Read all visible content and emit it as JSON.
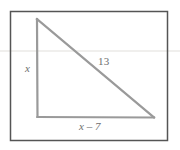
{
  "figure": {
    "kind": "geometry-diagram",
    "shape": "right-triangle",
    "background_color": "#ffffff",
    "frame": {
      "name": "diagram-border",
      "color": "#555555",
      "stroke_width": 1.5,
      "x": 10.5,
      "y": 11.5,
      "width": 157,
      "height": 129
    },
    "triangle": {
      "color": "#9a9a9a",
      "stroke_width": 2.2,
      "vertices": {
        "apex": {
          "x": 37,
          "y": 19
        },
        "bottom_left": {
          "x": 37.5,
          "y": 117
        },
        "bottom_right": {
          "x": 154,
          "y": 117.5
        }
      }
    },
    "labels": {
      "leg_vertical": "x",
      "hypotenuse": "13",
      "leg_horizontal": "x – 7"
    },
    "artifacts": {
      "scan_line_color": "#f0efed",
      "scan_line_y": 51
    }
  },
  "chart_data": {
    "type": "diagram",
    "title": "",
    "shape": "right triangle",
    "sides": [
      {
        "name": "vertical-leg",
        "label": "x",
        "from": "apex",
        "to": "bottom-left",
        "length_px": 98
      },
      {
        "name": "hypotenuse",
        "label": "13",
        "from": "apex",
        "to": "bottom-right",
        "length_px": 152
      },
      {
        "name": "horizontal-leg",
        "label": "x – 7",
        "from": "bottom-left",
        "to": "bottom-right",
        "length_px": 116
      }
    ],
    "right_angle_at": "bottom-left",
    "annotations": [
      "x",
      "13",
      "x – 7"
    ]
  }
}
